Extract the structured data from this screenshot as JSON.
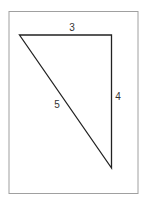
{
  "diagram": {
    "labels": {
      "top_side": "3",
      "right_side": "4",
      "hypotenuse": "5"
    },
    "colors": {
      "frame": "#999999",
      "triangle": "#222222",
      "text": "#333333",
      "background": "#ffffff"
    }
  }
}
